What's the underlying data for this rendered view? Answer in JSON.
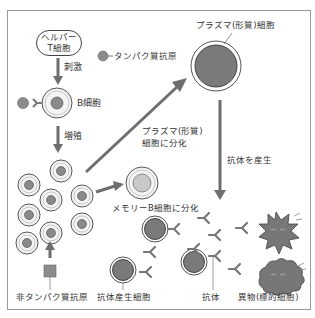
{
  "diagram": {
    "helper_t_cell": {
      "line1": "ヘルパー",
      "line2": "T細胞"
    },
    "labels": {
      "stimulation": "刺激",
      "protein_antigen": "タンパク質抗原",
      "b_cell": "B細胞",
      "proliferation": "増殖",
      "plasma_cell": "プラズマ(形質)細胞",
      "plasma_diff_line1": "プラズマ(形質)",
      "plasma_diff_line2": "細胞に分化",
      "memory_b_diff": "メモリーB細胞に分化",
      "produce_antibody": "抗体を産生",
      "non_protein_antigen": "非タンパク質抗原",
      "antibody_producing_cell": "抗体産生細胞",
      "antibody": "抗体",
      "foreign_target": "異物(標的細胞)"
    },
    "colors": {
      "arrow": "#6e6e6e",
      "cell_outer": "#f2f2f2",
      "cell_nucleus": "#8a8a8a",
      "plasma_core": "#7a7a7a",
      "memory_nucleus": "#c8c8c8",
      "antigen": "#8c8c8c",
      "foreign": "#777777"
    }
  }
}
